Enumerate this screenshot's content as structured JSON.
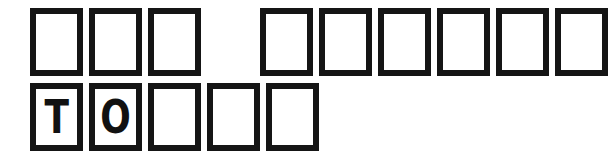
{
  "puzzle": {
    "type": "letter-box-word-puzzle",
    "background_color": "#ffffff",
    "box_border_color": "#151515",
    "letter_color": "#111111",
    "rows": [
      {
        "name": "top-row",
        "total_boxes": 9,
        "filled_letters": "",
        "groups": [
          {
            "name": "top-word-1",
            "letters": [
              "",
              "",
              ""
            ]
          },
          {
            "name": "top-word-2",
            "letters": [
              "",
              "",
              "",
              "",
              "",
              ""
            ]
          }
        ]
      },
      {
        "name": "bottom-row",
        "total_boxes": 5,
        "filled_letters": "TO",
        "groups": [
          {
            "name": "bottom-word-1",
            "letters": [
              "T",
              "O",
              "",
              "",
              ""
            ]
          }
        ]
      }
    ]
  }
}
